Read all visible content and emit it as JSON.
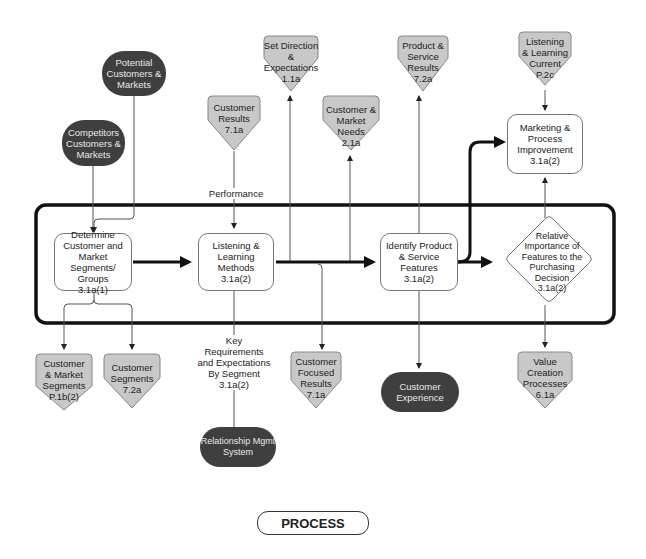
{
  "diagram": {
    "colors": {
      "process_fill": "#ffffff",
      "input_output_fill": "#c8c8c8",
      "external_fill": "#3f3f3f",
      "external_text": "#e8e8e8",
      "line": "#555555",
      "flow": "#111111"
    },
    "process_steps": [
      {
        "id": "determine",
        "label": "Determine\nCustomer and\nMarket Segments/\nGroups\n3.1a(1)"
      },
      {
        "id": "listening",
        "label": "Listening &\nLearning\nMethods\n3.1a(2)"
      },
      {
        "id": "identify",
        "label": "Identify Product\n& Service\nFeatures\n3.1a(2)"
      },
      {
        "id": "relative",
        "label": "Relative\nImportance of\nFeatures to the\nPurchasing\nDecision\n3.1a(2)"
      },
      {
        "id": "marketing",
        "label": "Marketing &\nProcess\nImprovement\n3.1a(2)"
      }
    ],
    "external_sources": [
      {
        "id": "potential",
        "label": "Potential\nCustomers &\nMarkets"
      },
      {
        "id": "competitors",
        "label": "Competitors\nCustomers &\nMarkets"
      },
      {
        "id": "relationship",
        "label": "Relationship Mgmt\nSystem"
      },
      {
        "id": "experience",
        "label": "Customer\nExperience"
      }
    ],
    "linked_items": [
      {
        "id": "set_direction",
        "label": "Set Direction\n&\nExpectations\n1.1a"
      },
      {
        "id": "customer_results",
        "label": "Customer\nResults\n7.1a"
      },
      {
        "id": "market_needs",
        "label": "Customer &\nMarket Needs\n2.1a"
      },
      {
        "id": "product_results",
        "label": "Product &\nService\nResults\n7.2a"
      },
      {
        "id": "listening_current",
        "label": "Listening\n& Learning\nCurrent\nP.2c"
      },
      {
        "id": "market_segments",
        "label": "Customer\n& Market\nSegments\nP.1b(2)"
      },
      {
        "id": "customer_segments",
        "label": "Customer\nSegments\n7.2a"
      },
      {
        "id": "focused_results",
        "label": "Customer\nFocused\nResults\n7.1a"
      },
      {
        "id": "value_creation",
        "label": "Value\nCreation\nProcesses\n6.1a"
      }
    ],
    "annotations": {
      "performance": "Performance",
      "key_requirements": "Key\nRequirements\nand Expectations\nBy Segment\n3.1a(2)"
    },
    "legend": {
      "process": "PROCESS"
    }
  }
}
